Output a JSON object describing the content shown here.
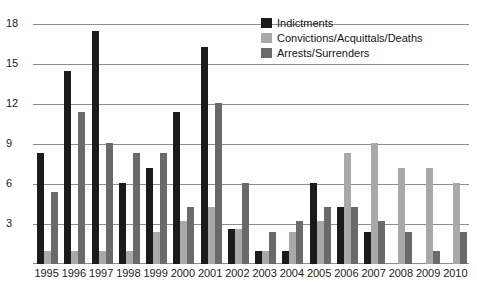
{
  "chart_data": {
    "type": "bar",
    "title": "",
    "subtitle": "",
    "xlabel": "",
    "ylabel": "",
    "ylim": [
      0,
      18.6
    ],
    "yticks": [
      3,
      6,
      9,
      12,
      15,
      18
    ],
    "ytick_labels": [
      "3",
      "6",
      "9",
      "12",
      "15",
      "18"
    ],
    "grid": true,
    "legend_position": "top-right",
    "categories": [
      "1995",
      "1996",
      "1997",
      "1998",
      "1999",
      "2000",
      "2001",
      "2002",
      "2003",
      "2004",
      "2005",
      "2006",
      "2007",
      "2008",
      "2009",
      "2010"
    ],
    "series": [
      {
        "name": "Indictments",
        "color": "#1b1b1b",
        "values": [
          8.3,
          14.5,
          17.5,
          6.1,
          7.2,
          11.4,
          16.3,
          2.6,
          1.0,
          1.0,
          6.1,
          4.3,
          2.4,
          0,
          0,
          0
        ]
      },
      {
        "name": "Convictions/Acquittals/Deaths",
        "color": "#a9a9a9",
        "values": [
          1.0,
          1.0,
          1.0,
          1.0,
          2.4,
          3.2,
          4.3,
          2.6,
          1.0,
          2.4,
          3.2,
          8.3,
          9.1,
          7.2,
          7.2,
          6.1
        ]
      },
      {
        "name": "Arrests/Surrenders",
        "color": "#6a6a6a",
        "values": [
          5.4,
          11.4,
          9.1,
          8.3,
          8.3,
          4.3,
          12.1,
          6.1,
          2.4,
          3.2,
          4.3,
          4.3,
          3.2,
          2.4,
          1.0,
          2.4
        ]
      }
    ]
  },
  "legend": {
    "items": [
      {
        "label": "Indictments",
        "swatch_name": "legend-swatch-indictments",
        "color": "#1b1b1b"
      },
      {
        "label": "Convictions/Acquittals/Deaths",
        "swatch_name": "legend-swatch-convictions",
        "color": "#a9a9a9"
      },
      {
        "label": "Arrests/Surrenders",
        "swatch_name": "legend-swatch-arrests",
        "color": "#6a6a6a"
      }
    ]
  }
}
